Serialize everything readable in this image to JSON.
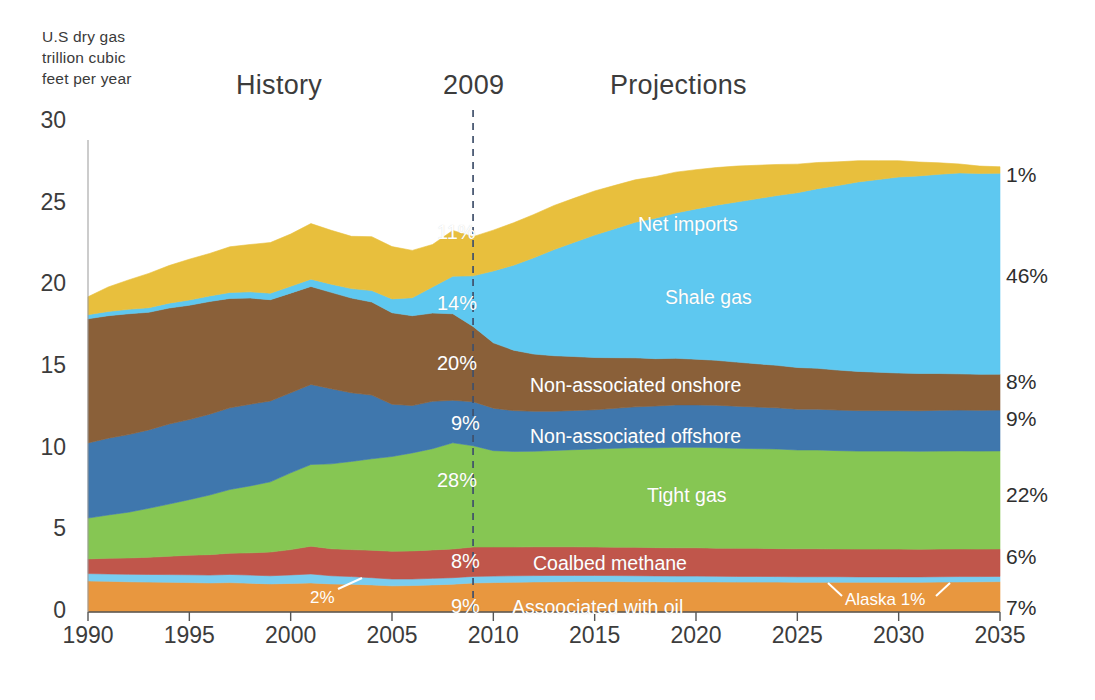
{
  "figure": {
    "axis_unit_label": "U.S dry gas\ntrillion cubic\nfeet per year",
    "history_title": "History",
    "divider_year_title": "2009",
    "projections_title": "Projections"
  },
  "chart_data": {
    "type": "area",
    "title": "",
    "subtitle": "",
    "xlabel": "",
    "ylabel": "U.S dry gas trillion cubic feet per year",
    "stacked": true,
    "grid": false,
    "legend": "in-plot labels",
    "xlim": [
      1990,
      2035
    ],
    "ylim": [
      0,
      30
    ],
    "yticks": [
      0,
      5,
      10,
      15,
      20,
      25,
      30
    ],
    "xticks": [
      1990,
      1995,
      2000,
      2005,
      2010,
      2015,
      2020,
      2025,
      2030,
      2035
    ],
    "divider_year": 2009,
    "x": [
      1990,
      1991,
      1992,
      1993,
      1994,
      1995,
      1996,
      1997,
      1998,
      1999,
      2000,
      2001,
      2002,
      2003,
      2004,
      2005,
      2006,
      2007,
      2008,
      2009,
      2010,
      2011,
      2012,
      2013,
      2014,
      2015,
      2016,
      2017,
      2018,
      2019,
      2020,
      2021,
      2022,
      2023,
      2024,
      2025,
      2026,
      2027,
      2028,
      2029,
      2030,
      2031,
      2032,
      2033,
      2034,
      2035
    ],
    "series": [
      {
        "name": "Associated with oil",
        "color": "#e8973f",
        "pct_2009": "9%",
        "pct_2035": "7%",
        "values": [
          1.9,
          1.88,
          1.85,
          1.83,
          1.82,
          1.8,
          1.78,
          1.8,
          1.76,
          1.72,
          1.75,
          1.78,
          1.72,
          1.7,
          1.66,
          1.6,
          1.62,
          1.66,
          1.7,
          1.78,
          1.8,
          1.82,
          1.84,
          1.85,
          1.86,
          1.86,
          1.86,
          1.85,
          1.85,
          1.84,
          1.84,
          1.84,
          1.83,
          1.83,
          1.83,
          1.82,
          1.82,
          1.82,
          1.82,
          1.82,
          1.82,
          1.82,
          1.83,
          1.84,
          1.85,
          1.86
        ]
      },
      {
        "name": "Alaska",
        "color": "#79cdf0",
        "pct_history": "2%",
        "pct_2035": "1%",
        "values": [
          0.45,
          0.45,
          0.46,
          0.47,
          0.47,
          0.48,
          0.48,
          0.5,
          0.5,
          0.5,
          0.52,
          0.55,
          0.5,
          0.47,
          0.44,
          0.42,
          0.4,
          0.4,
          0.4,
          0.4,
          0.4,
          0.4,
          0.39,
          0.39,
          0.38,
          0.38,
          0.37,
          0.37,
          0.36,
          0.36,
          0.36,
          0.35,
          0.35,
          0.35,
          0.34,
          0.34,
          0.34,
          0.34,
          0.33,
          0.33,
          0.33,
          0.33,
          0.33,
          0.33,
          0.32,
          0.32
        ]
      },
      {
        "name": "Coalbed methane",
        "color": "#c0564b",
        "pct_2009": "8%",
        "pct_2035": "6%",
        "values": [
          0.9,
          0.96,
          1.0,
          1.05,
          1.12,
          1.2,
          1.25,
          1.3,
          1.36,
          1.45,
          1.55,
          1.7,
          1.65,
          1.65,
          1.68,
          1.7,
          1.72,
          1.74,
          1.76,
          1.8,
          1.78,
          1.76,
          1.76,
          1.75,
          1.75,
          1.74,
          1.74,
          1.74,
          1.73,
          1.73,
          1.73,
          1.72,
          1.72,
          1.72,
          1.71,
          1.71,
          1.71,
          1.7,
          1.7,
          1.7,
          1.7,
          1.69,
          1.69,
          1.69,
          1.68,
          1.68
        ]
      },
      {
        "name": "Tight gas",
        "color": "#86c653",
        "pct_2009": "28%",
        "pct_2035": "22%",
        "values": [
          2.5,
          2.65,
          2.8,
          3.0,
          3.2,
          3.4,
          3.65,
          3.9,
          4.1,
          4.3,
          4.7,
          5.0,
          5.2,
          5.4,
          5.6,
          5.8,
          6.0,
          6.2,
          6.5,
          6.2,
          5.9,
          5.85,
          5.85,
          5.9,
          5.95,
          6.0,
          6.05,
          6.1,
          6.12,
          6.15,
          6.15,
          6.15,
          6.12,
          6.1,
          6.1,
          6.05,
          6.05,
          6.02,
          6.0,
          6.0,
          6.0,
          6.0,
          6.0,
          6.0,
          6.0,
          6.0
        ]
      },
      {
        "name": "Non-associated offshore",
        "color": "#3f77ad",
        "pct_2009": "9%",
        "pct_2035": "9%",
        "values": [
          4.6,
          4.7,
          4.75,
          4.8,
          4.9,
          4.9,
          4.95,
          5.0,
          5.0,
          4.95,
          4.9,
          4.9,
          4.6,
          4.2,
          3.9,
          3.2,
          2.9,
          2.9,
          2.6,
          2.7,
          2.6,
          2.5,
          2.45,
          2.4,
          2.4,
          2.4,
          2.45,
          2.5,
          2.55,
          2.6,
          2.6,
          2.6,
          2.58,
          2.55,
          2.52,
          2.5,
          2.5,
          2.48,
          2.48,
          2.48,
          2.48,
          2.48,
          2.5,
          2.5,
          2.5,
          2.5
        ]
      },
      {
        "name": "Non-associated onshore",
        "color": "#8a6039",
        "pct_2009": "20%",
        "pct_2035": "8%",
        "values": [
          7.6,
          7.5,
          7.4,
          7.2,
          7.1,
          7.0,
          6.9,
          6.7,
          6.5,
          6.2,
          6.1,
          6.0,
          5.9,
          5.8,
          5.7,
          5.6,
          5.5,
          5.4,
          5.3,
          4.6,
          4.0,
          3.7,
          3.5,
          3.4,
          3.3,
          3.2,
          3.1,
          3.0,
          2.9,
          2.85,
          2.8,
          2.75,
          2.7,
          2.65,
          2.6,
          2.55,
          2.5,
          2.45,
          2.4,
          2.35,
          2.3,
          2.28,
          2.25,
          2.22,
          2.2,
          2.2
        ]
      },
      {
        "name": "Shale gas",
        "color": "#5ec8f0",
        "pct_2009": "14%",
        "pct_2035": "46%",
        "values": [
          0.25,
          0.26,
          0.27,
          0.28,
          0.3,
          0.32,
          0.34,
          0.36,
          0.38,
          0.4,
          0.42,
          0.45,
          0.5,
          0.58,
          0.7,
          0.85,
          1.1,
          1.6,
          2.3,
          3.1,
          4.4,
          5.2,
          5.9,
          6.5,
          7.0,
          7.5,
          7.9,
          8.3,
          8.6,
          8.9,
          9.2,
          9.5,
          9.8,
          10.1,
          10.4,
          10.7,
          11.0,
          11.3,
          11.6,
          11.8,
          12.0,
          12.1,
          12.2,
          12.3,
          12.3,
          12.3
        ]
      },
      {
        "name": "Net imports",
        "color": "#e8bf3d",
        "pct_2009": "11%",
        "pct_2035": "1%",
        "values": [
          1.1,
          1.5,
          1.8,
          2.1,
          2.3,
          2.5,
          2.6,
          2.8,
          2.9,
          3.1,
          3.2,
          3.4,
          3.3,
          3.2,
          3.3,
          3.2,
          2.9,
          2.6,
          2.8,
          2.4,
          2.5,
          2.6,
          2.65,
          2.7,
          2.7,
          2.7,
          2.65,
          2.6,
          2.55,
          2.5,
          2.4,
          2.3,
          2.2,
          2.05,
          1.9,
          1.75,
          1.6,
          1.45,
          1.3,
          1.15,
          1.0,
          0.85,
          0.7,
          0.55,
          0.45,
          0.4
        ]
      }
    ],
    "inner_labels": [
      {
        "text": "Net imports",
        "x": 638,
        "y": 213
      },
      {
        "text": "Shale gas",
        "x": 665,
        "y": 286
      },
      {
        "text": "Non-associated onshore",
        "x": 530,
        "y": 374
      },
      {
        "text": "Non-associated offshore",
        "x": 530,
        "y": 425
      },
      {
        "text": "Tight gas",
        "x": 647,
        "y": 484
      },
      {
        "text": "Coalbed methane",
        "x": 533,
        "y": 552
      },
      {
        "text": "Assoociated with oil",
        "x": 512,
        "y": 596
      }
    ],
    "inner_pct_labels": [
      {
        "text": "11%",
        "x": 437,
        "y": 221
      },
      {
        "text": "14%",
        "x": 437,
        "y": 292
      },
      {
        "text": "20%",
        "x": 437,
        "y": 352
      },
      {
        "text": "9%",
        "x": 451,
        "y": 412
      },
      {
        "text": "28%",
        "x": 437,
        "y": 469
      },
      {
        "text": "8%",
        "x": 451,
        "y": 550
      },
      {
        "text": "9%",
        "x": 451,
        "y": 595
      }
    ],
    "callouts": [
      {
        "text": "2%",
        "x": 310,
        "y": 588
      },
      {
        "text": "Alaska  1%",
        "x": 845,
        "y": 590
      }
    ],
    "right_labels": [
      {
        "text": "1%",
        "y": 163
      },
      {
        "text": "46%",
        "y": 264
      },
      {
        "text": "8%",
        "y": 370
      },
      {
        "text": "9%",
        "y": 407
      },
      {
        "text": "22%",
        "y": 483
      },
      {
        "text": "6%",
        "y": 545
      },
      {
        "text": "7%",
        "y": 596
      }
    ]
  }
}
